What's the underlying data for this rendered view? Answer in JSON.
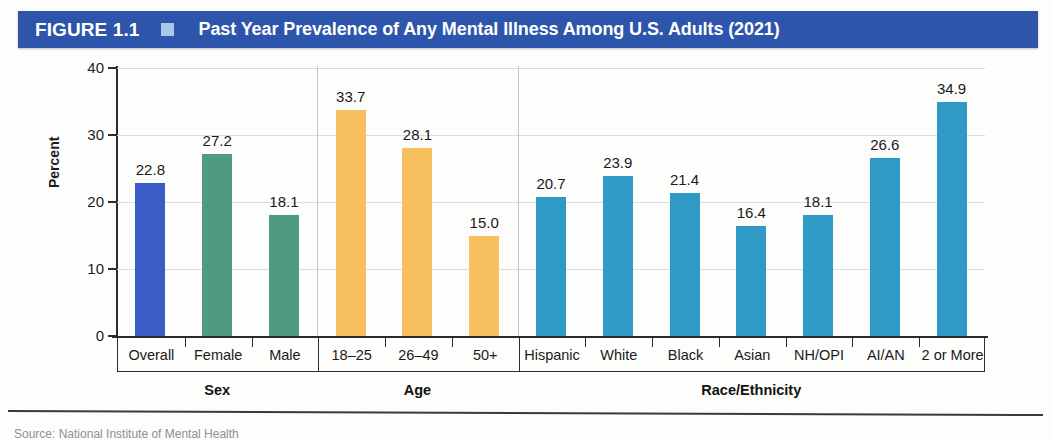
{
  "banner": {
    "figure_label": "FIGURE 1.1",
    "marker_icon": "square-marker-icon",
    "title": "Past Year Prevalence of Any Mental Illness Among U.S. Adults (2021)",
    "background_color": "#2d55ac",
    "marker_color": "#a9c8e8",
    "text_color": "#ffffff"
  },
  "footer": {
    "source": "Source: National Institute of Mental Health"
  },
  "chart_data": {
    "type": "bar",
    "title": "Past Year Prevalence of Any Mental Illness Among U.S. Adults (2021)",
    "xlabel": "",
    "ylabel": "Percent",
    "ylim": [
      0,
      40
    ],
    "yticks": [
      0,
      10,
      20,
      30,
      40
    ],
    "ytick_labels": [
      "0",
      "10",
      "20",
      "30",
      "40"
    ],
    "grid": true,
    "legend_position": "none",
    "categories": [
      "Overall",
      "Female",
      "Male",
      "18–25",
      "26–49",
      "50+",
      "Hispanic",
      "White",
      "Black",
      "Asian",
      "NH/OPI",
      "AI/AN",
      "2 or More"
    ],
    "values": [
      22.8,
      27.2,
      18.1,
      33.7,
      28.1,
      15.0,
      20.7,
      23.9,
      21.4,
      16.4,
      18.1,
      26.6,
      34.9
    ],
    "value_labels": [
      "22.8",
      "27.2",
      "18.1",
      "33.7",
      "28.1",
      "15.0",
      "20.7",
      "23.9",
      "21.4",
      "16.4",
      "18.1",
      "26.6",
      "34.9"
    ],
    "bar_colors": [
      "#3b5cc4",
      "#4f9b82",
      "#4f9b82",
      "#f7bf5e",
      "#f7bf5e",
      "#f7bf5e",
      "#2f9bc4",
      "#2f9bc4",
      "#2f9bc4",
      "#2f9bc4",
      "#2f9bc4",
      "#2f9bc4",
      "#2f9bc4"
    ],
    "groups": [
      {
        "label": "Sex",
        "start": 0,
        "count": 3,
        "color": "#4f9b82"
      },
      {
        "label": "Age",
        "start": 3,
        "count": 3,
        "color": "#f7bf5e"
      },
      {
        "label": "Race/Ethnicity",
        "start": 6,
        "count": 7,
        "color": "#2f9bc4"
      }
    ]
  }
}
